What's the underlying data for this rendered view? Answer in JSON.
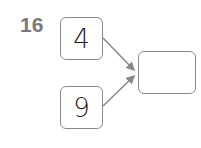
{
  "problem": {
    "number": "16",
    "inputs": [
      {
        "value": "4"
      },
      {
        "value": "9"
      }
    ],
    "answer": {
      "value": ""
    },
    "colors": {
      "border": "#8a8a8a",
      "arrow": "#888888",
      "number": "#7a7a7a"
    }
  }
}
